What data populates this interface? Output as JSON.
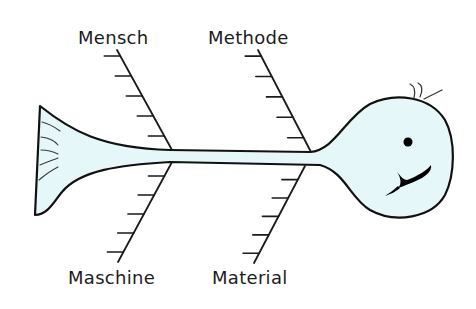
{
  "diagram": {
    "type": "fishbone (Ishikawa) diagram",
    "categories": {
      "top_left": "Mensch",
      "top_right": "Methode",
      "bottom_left": "Maschine",
      "bottom_right": "Material"
    },
    "ribs_per_bone": 5,
    "colors": {
      "fish_fill": "#e6f7fa",
      "outline": "#111111",
      "text": "#1c1c1c",
      "background": "#ffffff"
    }
  }
}
